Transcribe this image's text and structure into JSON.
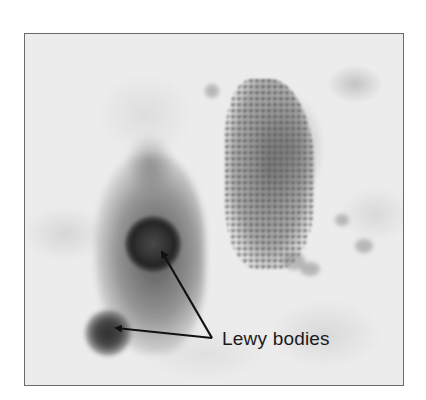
{
  "figure": {
    "type": "micrograph",
    "colorscale": "grayscale",
    "annotation": {
      "label": "Lewy bodies",
      "arrow_count": 2,
      "arrow_color": "#111111"
    },
    "frame_border_color": "#6a6a6a"
  }
}
